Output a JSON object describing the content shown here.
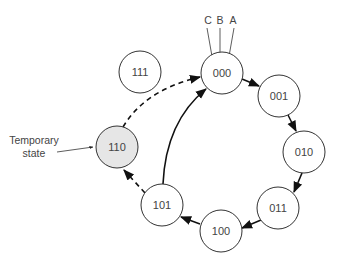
{
  "diagram": {
    "type": "state-diagram",
    "nodes": [
      {
        "id": "000",
        "label": "000",
        "cx": 222,
        "cy": 73,
        "temporary": false
      },
      {
        "id": "001",
        "label": "001",
        "cx": 279,
        "cy": 96,
        "temporary": false
      },
      {
        "id": "010",
        "label": "010",
        "cx": 304,
        "cy": 152,
        "temporary": false
      },
      {
        "id": "011",
        "label": "011",
        "cx": 278,
        "cy": 208,
        "temporary": false
      },
      {
        "id": "100",
        "label": "100",
        "cx": 221,
        "cy": 230,
        "temporary": false
      },
      {
        "id": "101",
        "label": "101",
        "cx": 162,
        "cy": 205,
        "temporary": false
      },
      {
        "id": "110",
        "label": "110",
        "cx": 117,
        "cy": 147,
        "temporary": true
      },
      {
        "id": "111",
        "label": "111",
        "cx": 140,
        "cy": 72,
        "temporary": false
      }
    ],
    "edges": [
      {
        "from": "000",
        "to": "001",
        "style": "solid"
      },
      {
        "from": "001",
        "to": "010",
        "style": "solid"
      },
      {
        "from": "010",
        "to": "011",
        "style": "solid"
      },
      {
        "from": "011",
        "to": "100",
        "style": "solid"
      },
      {
        "from": "100",
        "to": "101",
        "style": "solid"
      },
      {
        "from": "101",
        "to": "000",
        "style": "solid"
      },
      {
        "from": "101",
        "to": "110",
        "style": "dashed"
      },
      {
        "from": "110",
        "to": "000",
        "style": "dashed"
      }
    ],
    "inputs": [
      {
        "label": "C"
      },
      {
        "label": "B"
      },
      {
        "label": "A"
      }
    ],
    "annotation": {
      "line1": "Temporary",
      "line2": "state",
      "target": "110"
    }
  }
}
